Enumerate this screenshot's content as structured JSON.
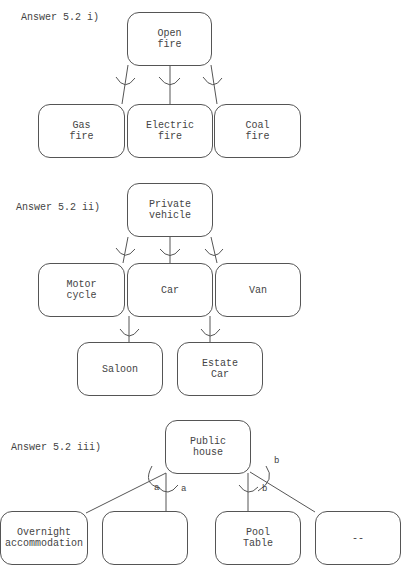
{
  "diagrams": [
    {
      "label": "Answer 5.2 i)",
      "root": "Open\nfire",
      "children": [
        "Gas\nfire",
        "Electric\nfire",
        "Coal\nfire"
      ]
    },
    {
      "label": "Answer 5.2 ii)",
      "root": "Private\nvehicle",
      "children": [
        "Motor\ncycle",
        "Car",
        "Van"
      ],
      "grandchildren": [
        "Saloon",
        "Estate\nCar"
      ]
    },
    {
      "label": "Answer 5.2 iii)",
      "root": "Public\nhouse",
      "children": [
        "Overnight\naccommodation",
        "",
        "Pool\nTable",
        "--"
      ],
      "marks": [
        "a",
        "a",
        "b",
        "b"
      ]
    }
  ]
}
